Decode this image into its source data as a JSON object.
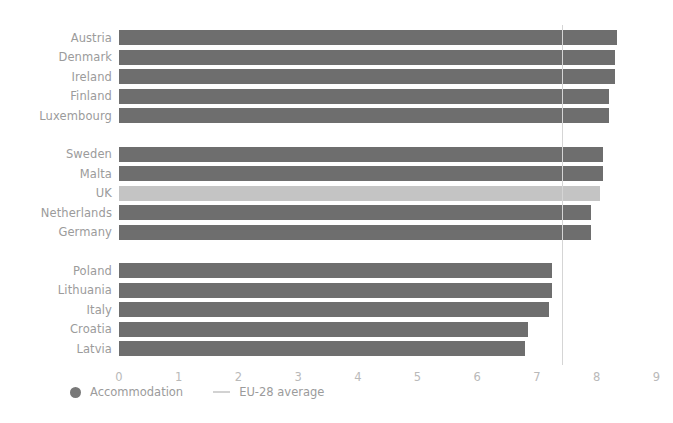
{
  "chart_data": {
    "type": "bar",
    "orientation": "horizontal",
    "title": "",
    "subtitle": "",
    "xlabel": "",
    "ylabel": "",
    "xlim": [
      0,
      9
    ],
    "xticks": [
      "0",
      "1",
      "2",
      "3",
      "4",
      "5",
      "6",
      "7",
      "8",
      "9"
    ],
    "grid": false,
    "legend_position": "bottom-left",
    "groups": [
      {
        "name": "group-1",
        "categories": [
          "Austria",
          "Denmark",
          "Ireland",
          "Finland",
          "Luxembourg"
        ],
        "values": [
          8.35,
          8.3,
          8.3,
          8.2,
          8.2
        ]
      },
      {
        "name": "group-2",
        "categories": [
          "Sweden",
          "Malta",
          "UK",
          "Netherlands",
          "Germany"
        ],
        "values": [
          8.1,
          8.1,
          8.05,
          7.9,
          7.9
        ]
      },
      {
        "name": "group-3",
        "categories": [
          "Poland",
          "Lithuania",
          "Italy",
          "Croatia",
          "Latvia"
        ],
        "values": [
          7.25,
          7.25,
          7.2,
          6.85,
          6.8
        ]
      }
    ],
    "highlight_category": "UK",
    "reference_line": {
      "label": "EU-28 average",
      "value": 7.42
    },
    "series_name": "Accommodation",
    "colors": {
      "bar": "#6e6e6e",
      "bar_highlight": "#c4c4c4",
      "reference_line": "#d5d5d5",
      "label_text": "#9b9b9b",
      "tick_text": "#b9b9b9",
      "background": "#ffffff"
    }
  },
  "legend": {
    "series_label": "Accommodation",
    "reference_label": "EU-28 average"
  }
}
